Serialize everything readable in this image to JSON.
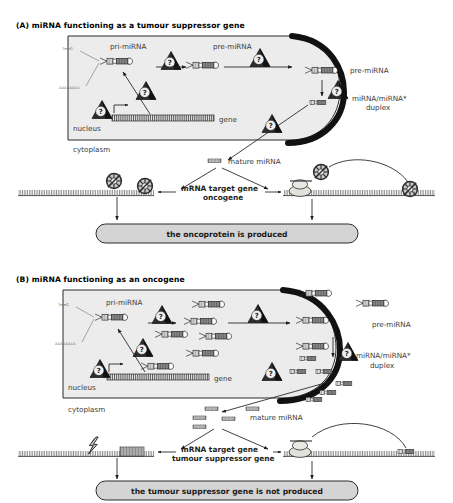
{
  "figure": {
    "type": "biological-pathway-diagram",
    "background_color": "#ffffff",
    "ink_color": "#231f20",
    "fill_grey": "#d9d9d9",
    "panel_fill": "#ececec"
  },
  "panels": [
    {
      "id": "A",
      "title": "(A) miRNA functioning as a tumour suppressor gene",
      "compartments": {
        "nucleus": "nucleus",
        "cytoplasm": "cytoplasm"
      },
      "labels": {
        "cap": "7meG",
        "polya": "AAAAAAAA",
        "gene": "gene",
        "pri_mirna": "pri-miRNA",
        "pre_mirna_nucleus": "pre-miRNA",
        "pre_mirna_cytoplasm": "pre-miRNA",
        "duplex": "miRNA/miRNA*\nduplex",
        "duplex_line1": "miRNA/miRNA*",
        "duplex_line2": "duplex",
        "mature": "mature miRNA",
        "target_line1": "mRNA target gene",
        "target_line2": "oncogene",
        "outcome": "the oncoprotein is produced"
      },
      "icon_count_question_triangles": 5
    },
    {
      "id": "B",
      "title": "(B) miRNA functioning as an oncogene",
      "compartments": {
        "nucleus": "nucleus",
        "cytoplasm": "cytoplasm"
      },
      "labels": {
        "cap": "7meG",
        "polya": "AAAAAAAA",
        "gene": "gene",
        "pri_mirna": "pri-miRNA",
        "pre_mirna_cytoplasm": "pre-miRNA",
        "duplex_line1": "miRNA/miRNA*",
        "duplex_line2": "duplex",
        "mature": "mature miRNA",
        "target_line1": "mRNA target gene",
        "target_line2": "tumour suppressor gene",
        "outcome": "the tumour suppressor gene is not produced"
      },
      "icon_count_question_triangles": 5
    }
  ],
  "icons": {
    "question_triangle": "question-mark-triangle-icon",
    "ribosome": "ribosome-icon",
    "blocked_ribosome": "blocked-ribosome-icon",
    "lightning": "lightning-bolt-icon",
    "hairpin": "hairpin-rna-icon",
    "duplex": "rna-duplex-icon",
    "mature_strand": "mature-mirna-strand-icon"
  }
}
